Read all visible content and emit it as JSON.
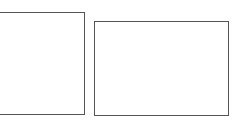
{
  "diagram": {
    "shapes": [
      {
        "id": "left-rectangle",
        "type": "rectangle",
        "label": "",
        "stroke": "#555555",
        "fill": "#ffffff"
      },
      {
        "id": "right-rectangle",
        "type": "rectangle",
        "label": "",
        "stroke": "#555555",
        "fill": "#ffffff"
      }
    ]
  }
}
